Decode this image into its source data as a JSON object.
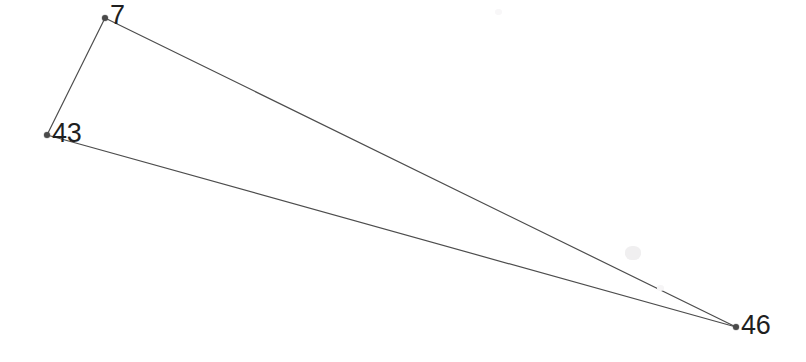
{
  "graph": {
    "title": "",
    "background_color": "#ffffff",
    "edge_color": "#4d4d4d",
    "edge_width": 1.2,
    "node_marker_color": "#4a4a4a",
    "node_marker_radius": 3,
    "label_color": "#1f1f1f",
    "label_font_size": 27,
    "width": 806,
    "height": 362,
    "nodes": [
      {
        "id": "7",
        "label": "7",
        "x": 105,
        "y": 18,
        "label_x": 110,
        "label_y": 2
      },
      {
        "id": "43",
        "label": "43",
        "x": 47,
        "y": 135,
        "label_x": 52,
        "label_y": 120
      },
      {
        "id": "46",
        "label": "46",
        "x": 736,
        "y": 327,
        "label_x": 741,
        "label_y": 312
      }
    ],
    "edges": [
      {
        "from": "7",
        "to": "43"
      },
      {
        "from": "7",
        "to": "46"
      },
      {
        "from": "43",
        "to": "46"
      }
    ],
    "artifacts": [
      {
        "x": 625,
        "y": 246,
        "width": 16,
        "height": 14,
        "color": "#f0eff0"
      },
      {
        "x": 657,
        "y": 285,
        "width": 7,
        "height": 6,
        "color": "#f6f5f6"
      },
      {
        "x": 495,
        "y": 9,
        "width": 7,
        "height": 6,
        "color": "#f8f7f8"
      }
    ]
  }
}
